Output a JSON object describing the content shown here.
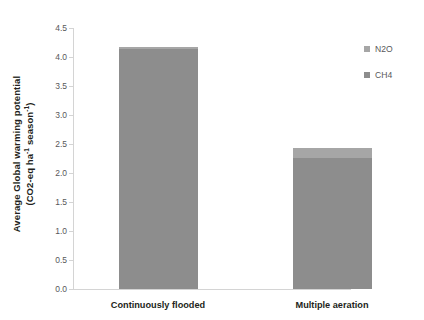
{
  "chart_data": {
    "type": "bar",
    "stacked": true,
    "title": "",
    "xlabel": "",
    "ylabel_line1": "Average  Global warming potential",
    "ylabel_line2_prefix": "(CO2-eq ha",
    "ylabel_line2_sup1": "-1",
    "ylabel_line2_mid": " season",
    "ylabel_line2_sup2": "-1",
    "ylabel_line2_suffix": ")",
    "categories": [
      "Continuously flooded",
      "Multiple aeration"
    ],
    "series": [
      {
        "name": "CH4",
        "values": [
          4.13,
          2.26
        ],
        "color": "#8d8d8d"
      },
      {
        "name": "N2O",
        "values": [
          0.05,
          0.17
        ],
        "color": "#a6a6a6"
      }
    ],
    "totals": [
      4.18,
      2.43
    ],
    "ylim": [
      0,
      4.5
    ],
    "yticks": [
      "0.0",
      "0.5",
      "1.0",
      "1.5",
      "2.0",
      "2.5",
      "3.0",
      "3.5",
      "4.0",
      "4.5"
    ],
    "ytick_values": [
      0,
      0.5,
      1,
      1.5,
      2,
      2.5,
      3,
      3.5,
      4,
      4.5
    ],
    "grid": false,
    "legend_position": "right",
    "legend": [
      {
        "label": "N2O",
        "color": "#a6a6a6"
      },
      {
        "label": "CH4",
        "color": "#8d8d8d"
      }
    ],
    "axis_color": "#d4d4d4",
    "tick_text_color": "#58585a",
    "label_text_color": "#231f20",
    "background": "#ffffff"
  }
}
